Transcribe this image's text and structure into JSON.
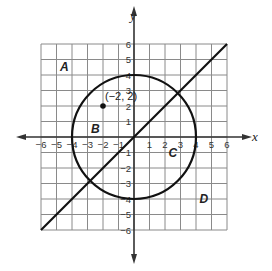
{
  "diagram": {
    "type": "coordinate-plane",
    "x_axis": {
      "label": "x",
      "min": -6,
      "max": 6,
      "ticks": [
        "-6",
        "-5",
        "-4",
        "-3",
        "-2",
        "-1",
        "1",
        "2",
        "3",
        "4",
        "5",
        "6"
      ]
    },
    "y_axis": {
      "label": "y",
      "min": -6,
      "max": 6,
      "ticks": [
        "6",
        "5",
        "4",
        "3",
        "2",
        "1",
        "-1",
        "-2",
        "-3",
        "-4",
        "-5",
        "-6"
      ]
    },
    "circle": {
      "center": [
        0,
        0
      ],
      "radius": 4
    },
    "line": {
      "from": [
        -6,
        -6
      ],
      "to": [
        6,
        6
      ],
      "equation": "y = x"
    },
    "point": {
      "coords": [
        -2,
        2
      ],
      "label": "(−2, 2)"
    },
    "regions": [
      {
        "label": "A",
        "at": [
          -4.5,
          4.5
        ]
      },
      {
        "label": "B",
        "at": [
          -2.5,
          0.5
        ]
      },
      {
        "label": "C",
        "at": [
          2.5,
          -1
        ]
      },
      {
        "label": "D",
        "at": [
          4.5,
          -4
        ]
      }
    ],
    "colors": {
      "grid": "#8a8a8a",
      "axes": "#333333",
      "curve": "#111111"
    }
  }
}
